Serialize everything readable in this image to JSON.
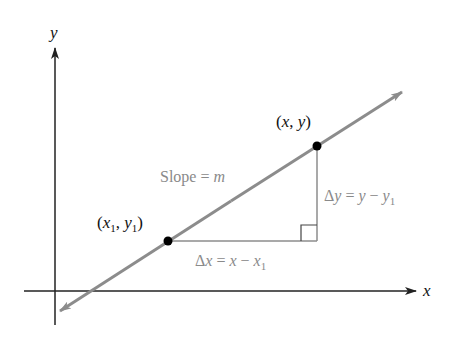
{
  "diagram": {
    "axes": {
      "x_label": "x",
      "y_label": "y",
      "axis_color": "#222222"
    },
    "line": {
      "color": "#8c8c8c",
      "label": "Slope = m",
      "label_prefix": "Slope = ",
      "label_var": "m"
    },
    "points": [
      {
        "name": "point-1",
        "label_open": "(",
        "label_x": "x",
        "label_sub_x": "1",
        "label_sep": ", ",
        "label_y": "y",
        "label_sub_y": "1",
        "label_close": ")",
        "display": "(x1, y1)"
      },
      {
        "name": "point-2",
        "label_open": "(",
        "label_x": "x",
        "label_sep": ", ",
        "label_y": "y",
        "label_close": ")",
        "display": "(x, y)"
      }
    ],
    "delta_x": {
      "display": "Δx = x − x1",
      "delta": "Δ",
      "var": "x",
      "eq": " = ",
      "rhs_a": "x",
      "minus": " − ",
      "rhs_b": "x",
      "sub": "1"
    },
    "delta_y": {
      "display": "Δy = y − y1",
      "delta": "Δ",
      "var": "y",
      "eq": " = ",
      "rhs_a": "y",
      "minus": " − ",
      "rhs_b": "y",
      "sub": "1"
    },
    "colors": {
      "line": "#8c8c8c",
      "triangle": "#8c8c8c",
      "points": "#000000",
      "axes": "#222222",
      "gray_text": "#8a8a8a"
    }
  }
}
